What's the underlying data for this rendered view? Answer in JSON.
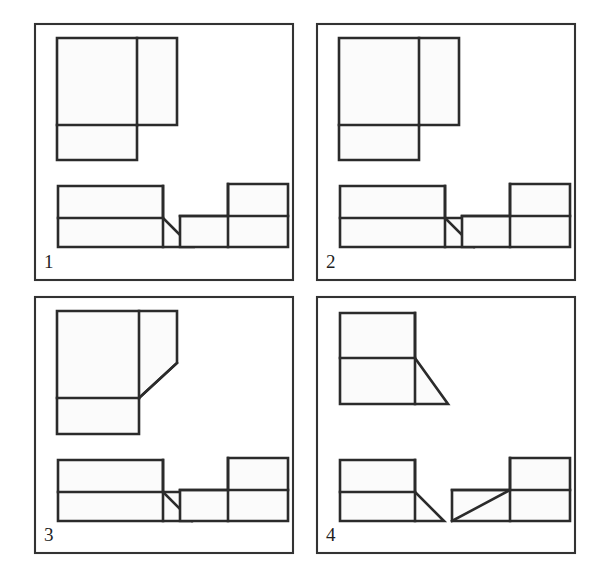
{
  "figure": {
    "background_color": "#ffffff",
    "line_color": "#2b2b2b",
    "frame_color": "#333333",
    "face_color": "#fbfbfb",
    "width": 605,
    "height": 582
  },
  "panels": [
    {
      "number": "1",
      "label_x": 44,
      "label_y": 268,
      "frame": {
        "x": 35,
        "y": 24,
        "w": 258,
        "h": 256
      },
      "shapes": [
        {
          "name": "top-L-solid",
          "outline": "57,38 177,38 177,125 137,125 137,160 57,160",
          "edges": [
            "137,38 137,125",
            "57,125 137,125"
          ]
        },
        {
          "name": "front-view-with-triangle",
          "outline": "58,186 163,186 163,218 192,247 58,247",
          "edges": [
            "58,218 163,218",
            "163,186 163,247"
          ]
        },
        {
          "name": "side-view-step",
          "outline": "228,184 288,184 288,247 180,247 180,216 228,216",
          "edges": [
            "180,216 288,216",
            "228,184 228,247"
          ]
        }
      ]
    },
    {
      "number": "2",
      "label_x": 326,
      "label_y": 268,
      "frame": {
        "x": 317,
        "y": 24,
        "w": 258,
        "h": 256
      },
      "shapes": [
        {
          "name": "top-L-solid",
          "outline": "339,38 459,38 459,125 419,125 419,160 339,160",
          "edges": [
            "419,38 419,125",
            "339,125 419,125"
          ]
        },
        {
          "name": "front-view-with-inner-diagonal",
          "outline": "340,186 445,186 445,218 474,218 474,247 340,247",
          "edges": [
            "340,218 445,218",
            "445,186 445,247",
            "445,218 474,247"
          ]
        },
        {
          "name": "side-view-step",
          "outline": "510,184 570,184 570,247 462,247 462,216 510,216",
          "edges": [
            "462,216 570,216",
            "510,184 510,247"
          ]
        }
      ]
    },
    {
      "number": "3",
      "label_x": 44,
      "label_y": 541,
      "frame": {
        "x": 35,
        "y": 297,
        "w": 258,
        "h": 256
      },
      "shapes": [
        {
          "name": "top-L-solid-chamfered",
          "outline": "57,311 177,311 177,363 139,398 139,434 57,434",
          "edges": [
            "139,311 139,398",
            "57,398 139,398",
            "139,398 177,363"
          ]
        },
        {
          "name": "front-view-with-inner-diagonal",
          "outline": "58,460 163,460 163,492 192,492 192,521 58,521",
          "edges": [
            "58,492 163,492",
            "163,460 163,521",
            "163,492 192,521"
          ]
        },
        {
          "name": "side-view-step",
          "outline": "228,458 288,458 288,521 180,521 180,490 228,490",
          "edges": [
            "180,490 288,490",
            "228,458 228,521"
          ]
        }
      ]
    },
    {
      "number": "4",
      "label_x": 326,
      "label_y": 541,
      "frame": {
        "x": 317,
        "y": 297,
        "w": 258,
        "h": 256
      },
      "shapes": [
        {
          "name": "top-two-rect-with-triangle",
          "outline": "340,313 415,313 415,358 448,404 340,404",
          "edges": [
            "340,358 415,358",
            "415,313 415,404"
          ]
        },
        {
          "name": "front-view-with-triangle",
          "outline": "340,460 415,460 415,492 444,521 340,521",
          "edges": [
            "340,492 415,492",
            "415,460 415,521"
          ]
        },
        {
          "name": "side-view-step-with-diagonal",
          "outline": "510,458 570,458 570,521 452,521 452,490 510,490",
          "edges": [
            "452,490 570,490",
            "510,458 510,521",
            "452,521 510,490"
          ]
        }
      ]
    }
  ]
}
